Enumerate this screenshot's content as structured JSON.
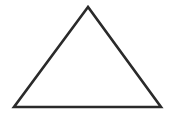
{
  "diagram": {
    "shape": "triangle",
    "background": "#ffffff",
    "stroke_color": "#2a2a2a",
    "stroke_width": 2.6,
    "fill": "none",
    "vertices": {
      "apex": [
        88,
        7
      ],
      "bottom_left": [
        14,
        107
      ],
      "bottom_right": [
        161,
        107
      ]
    }
  }
}
